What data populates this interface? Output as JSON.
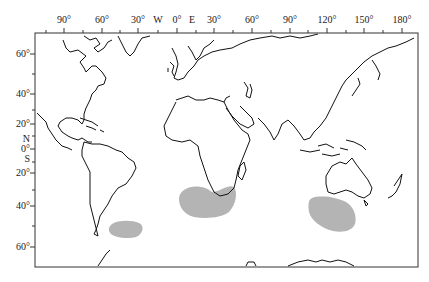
{
  "map": {
    "type": "world-map-mercator-like",
    "longitude_labels": [
      {
        "label": "90°",
        "x": 64
      },
      {
        "label": "60°",
        "x": 102
      },
      {
        "label": "30°",
        "x": 138
      },
      {
        "label": "W",
        "x": 158
      },
      {
        "label": "0°",
        "x": 177
      },
      {
        "label": "E",
        "x": 192
      },
      {
        "label": "30°",
        "x": 214
      },
      {
        "label": "60°",
        "x": 252
      },
      {
        "label": "90°",
        "x": 290
      },
      {
        "label": "120°",
        "x": 327
      },
      {
        "label": "150°",
        "x": 364
      },
      {
        "label": "180°",
        "x": 402
      }
    ],
    "latitude_labels": [
      {
        "label": "60°",
        "y": 54
      },
      {
        "label": "40°",
        "y": 94
      },
      {
        "label": "20°",
        "y": 124
      },
      {
        "label": "N",
        "y": 139
      },
      {
        "label": "0°",
        "y": 149
      },
      {
        "label": "S",
        "y": 159
      },
      {
        "label": "20°",
        "y": 173
      },
      {
        "label": "40°",
        "y": 206
      },
      {
        "label": "60°",
        "y": 247
      }
    ],
    "highlighted_regions": [
      {
        "name": "south-atlantic-off-argentina",
        "color": "#b4b4b4"
      },
      {
        "name": "southeast-atlantic-off-south-africa",
        "color": "#b4b4b4"
      },
      {
        "name": "southeast-indian-off-southwest-australia",
        "color": "#b4b4b4"
      }
    ],
    "colors": {
      "coastline": "#111111",
      "frame": "#333333",
      "highlight": "#b4b4b4",
      "background": "#ffffff"
    }
  }
}
